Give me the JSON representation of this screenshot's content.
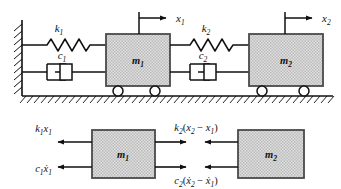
{
  "figure": {
    "colors": {
      "stroke": "#111111",
      "block_fill": "#d8d8d8",
      "block_border": "#4a4a4a",
      "background": "#ffffff"
    }
  },
  "schematic": {
    "name": "physical-model",
    "wall": {
      "label": "fixed-wall"
    },
    "ground": {
      "label": "ground-surface"
    },
    "springs": [
      {
        "id": "k1",
        "label": "k",
        "subscript": "1"
      },
      {
        "id": "k2",
        "label": "k",
        "subscript": "2"
      }
    ],
    "dampers": [
      {
        "id": "c1",
        "label": "c",
        "subscript": "1"
      },
      {
        "id": "c2",
        "label": "c",
        "subscript": "2"
      }
    ],
    "masses": [
      {
        "id": "m1",
        "label": "m",
        "subscript": "1"
      },
      {
        "id": "m2",
        "label": "m",
        "subscript": "2"
      }
    ],
    "displacements": [
      {
        "id": "x1",
        "label": "x",
        "subscript": "1"
      },
      {
        "id": "x2",
        "label": "x",
        "subscript": "2"
      }
    ]
  },
  "free_body": {
    "name": "free-body-diagram",
    "masses": [
      {
        "id": "m1",
        "label": "m",
        "subscript": "1"
      },
      {
        "id": "m2",
        "label": "m",
        "subscript": "2"
      }
    ],
    "forces": {
      "spring_left": {
        "id": "k1x1",
        "text": "k₁x₁",
        "parts": {
          "coef": "k",
          "coef_sub": "1",
          "var": "x",
          "var_sub": "1"
        },
        "direction": "left"
      },
      "damper_left": {
        "id": "c1x1dot",
        "text": "c₁ẋ₁",
        "parts": {
          "coef": "c",
          "coef_sub": "1",
          "var": "ẋ",
          "var_sub": "1"
        },
        "direction": "left"
      },
      "spring_coupling": {
        "id": "k2x2minusx1",
        "text": "k₂(x₂ − x₁)",
        "parts": {
          "coef": "k",
          "coef_sub": "2",
          "open": "(",
          "var_a": "x",
          "var_a_sub": "2",
          "minus": "−",
          "var_b": "x",
          "var_b_sub": "1",
          "close": ")"
        },
        "direction": "opposed-pair"
      },
      "damper_coupling": {
        "id": "c2x2dotminusx1dot",
        "text": "c₂(ẋ₂ − ẋ₁)",
        "parts": {
          "coef": "c",
          "coef_sub": "2",
          "open": "(",
          "var_a": "ẋ",
          "var_a_sub": "2",
          "minus": "−",
          "var_b": "ẋ",
          "var_b_sub": "1",
          "close": ")"
        },
        "direction": "opposed-pair"
      }
    }
  }
}
